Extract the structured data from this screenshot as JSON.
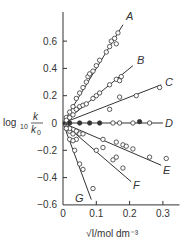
{
  "chart_data": {
    "type": "scatter",
    "title": "",
    "xlabel": "√I/mol dm⁻³",
    "ylabel": "log10 k/k0",
    "xlim": [
      0,
      0.35
    ],
    "ylim": [
      -0.6,
      0.8
    ],
    "x_ticks": [
      0,
      0.1,
      0.2,
      0.3
    ],
    "x_tick_labels": [
      "0",
      "0.1",
      "0.2",
      "0.3"
    ],
    "y_ticks": [
      -0.6,
      -0.4,
      -0.2,
      0,
      0.2,
      0.4,
      0.6
    ],
    "y_tick_labels": [
      "−0.6",
      "−0.4",
      "−0.2",
      "0",
      "0.2",
      "0.4",
      "0.6"
    ],
    "grid": false,
    "legend": "inline line labels",
    "series": [
      {
        "name": "A",
        "slope": 4.0,
        "x_end": 0.18,
        "marker": "open-circle",
        "points": [
          [
            0.01,
            0.04
          ],
          [
            0.02,
            0.08
          ],
          [
            0.03,
            0.12
          ],
          [
            0.04,
            0.18
          ],
          [
            0.05,
            0.22
          ],
          [
            0.06,
            0.26
          ],
          [
            0.07,
            0.3
          ],
          [
            0.075,
            0.34
          ],
          [
            0.08,
            0.36
          ],
          [
            0.09,
            0.38
          ],
          [
            0.1,
            0.42
          ],
          [
            0.11,
            0.46
          ],
          [
            0.13,
            0.52
          ],
          [
            0.14,
            0.56
          ],
          [
            0.145,
            0.6
          ],
          [
            0.155,
            0.62
          ],
          [
            0.16,
            0.58
          ],
          [
            0.165,
            0.66
          ]
        ]
      },
      {
        "name": "B",
        "slope": 2.0,
        "x_end": 0.21,
        "marker": "open-circle",
        "points": [
          [
            0.01,
            0.02
          ],
          [
            0.02,
            0.04
          ],
          [
            0.03,
            0.06
          ],
          [
            0.04,
            0.1
          ],
          [
            0.05,
            0.12
          ],
          [
            0.06,
            0.13
          ],
          [
            0.07,
            0.14
          ],
          [
            0.09,
            0.18
          ],
          [
            0.1,
            0.2
          ],
          [
            0.11,
            0.22
          ],
          [
            0.14,
            0.28
          ],
          [
            0.16,
            0.32
          ],
          [
            0.17,
            0.31
          ],
          [
            0.175,
            0.34
          ]
        ]
      },
      {
        "name": "C",
        "slope": 0.95,
        "x_end": 0.295,
        "marker": "open-circle",
        "points": [
          [
            0.14,
            0.1
          ],
          [
            0.17,
            0.19
          ],
          [
            0.22,
            0.2
          ],
          [
            0.29,
            0.26
          ]
        ]
      },
      {
        "name": "D",
        "slope": 0.0,
        "x_end": 0.3,
        "marker": "filled+open-circle",
        "points": [
          [
            0.02,
            0.0
          ],
          [
            0.05,
            0.0
          ],
          [
            0.08,
            0.0
          ],
          [
            0.11,
            0.0
          ],
          [
            0.15,
            0.0
          ],
          [
            0.17,
            0.0
          ],
          [
            0.21,
            0.0
          ],
          [
            0.23,
            0.01
          ],
          [
            0.26,
            0.0
          ]
        ]
      },
      {
        "name": "E",
        "slope": -1.05,
        "x_end": 0.295,
        "marker": "open-circle",
        "points": [
          [
            0.02,
            -0.06
          ],
          [
            0.04,
            -0.06
          ],
          [
            0.05,
            -0.08
          ],
          [
            0.06,
            -0.08
          ],
          [
            0.12,
            -0.12
          ],
          [
            0.16,
            -0.14
          ],
          [
            0.18,
            -0.16
          ],
          [
            0.19,
            -0.17
          ],
          [
            0.21,
            -0.19
          ],
          [
            0.26,
            -0.25
          ],
          [
            0.31,
            -0.26
          ]
        ]
      },
      {
        "name": "F",
        "slope": -2.1,
        "x_end": 0.205,
        "marker": "open-circle",
        "points": [
          [
            0.02,
            -0.04
          ],
          [
            0.03,
            -0.08
          ],
          [
            0.04,
            -0.12
          ],
          [
            0.1,
            -0.2
          ],
          [
            0.12,
            -0.18
          ],
          [
            0.15,
            -0.27
          ],
          [
            0.16,
            -0.25
          ],
          [
            0.18,
            -0.33
          ]
        ]
      },
      {
        "name": "G",
        "slope": -6.6,
        "x_end": 0.085,
        "marker": "open-circle",
        "points": [
          [
            0.01,
            -0.04
          ],
          [
            0.02,
            -0.12
          ],
          [
            0.03,
            -0.13
          ],
          [
            0.035,
            -0.2
          ],
          [
            0.05,
            -0.3
          ],
          [
            0.06,
            -0.34
          ],
          [
            0.09,
            -0.48
          ]
        ]
      }
    ]
  },
  "colors": {
    "ink": "#333333",
    "background": "#ffffff"
  }
}
